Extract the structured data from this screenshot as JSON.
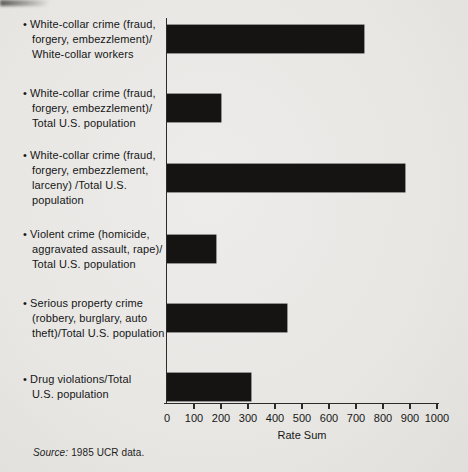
{
  "chart_data": {
    "type": "bar",
    "orientation": "horizontal",
    "bullet": "•",
    "categories": [
      "White-collar crime (fraud,\nforgery, embezzlement)/\nWhite-collar workers",
      "White-collar crime (fraud,\nforgery, embezzlement)/\nTotal U.S. population",
      "White-collar crime (fraud,\nforgery, embezzlement,\nlarceny) /Total U.S.\npopulation",
      "Violent crime (homicide,\naggravated assault, rape)/\nTotal U.S. population",
      "Serious property crime\n(robbery, burglary, auto\ntheft)/Total U.S. population",
      "Drug violations/Total\nU.S. population"
    ],
    "values": [
      730,
      200,
      880,
      180,
      445,
      310
    ],
    "xlabel": "Rate Sum",
    "xlim": [
      0,
      1000
    ],
    "ticks": [
      0,
      100,
      200,
      300,
      400,
      500,
      600,
      700,
      800,
      900,
      1000
    ],
    "grid": "off",
    "legend": "none",
    "bar_color": "#161412"
  },
  "footer": {
    "source_label": "Source:",
    "source_text": "1985 UCR data."
  }
}
